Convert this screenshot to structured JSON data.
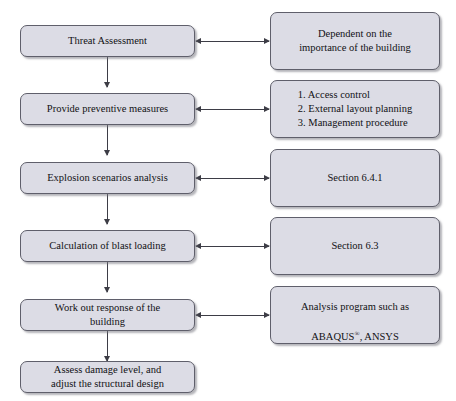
{
  "diagram": {
    "colors": {
      "node_fill": "#dcdce5",
      "node_border": "#5f5f6b",
      "connector": "#3d3d46",
      "background": "#ffffff",
      "text": "#111114"
    },
    "left_column": [
      {
        "id": "threat-assessment",
        "label": "Threat Assessment"
      },
      {
        "id": "preventive-measures",
        "label": "Provide preventive measures"
      },
      {
        "id": "explosion-scenarios",
        "label": "Explosion scenarios analysis"
      },
      {
        "id": "blast-loading",
        "label": "Calculation of blast loading"
      },
      {
        "id": "work-out-response",
        "label": "Work out response of the\nbuilding"
      },
      {
        "id": "assess-damage",
        "label": "Assess damage level, and\nadjust the structural design"
      }
    ],
    "right_column": [
      {
        "id": "dependent-importance",
        "label": "Dependent on the\nimportance of the building"
      },
      {
        "id": "preventive-measures-list",
        "label": "1. Access control\n2. External layout planning\n3. Management procedure"
      },
      {
        "id": "section-6-4-1",
        "label": "Section 6.4.1"
      },
      {
        "id": "section-6-3",
        "label": "Section 6.3"
      },
      {
        "id": "analysis-program",
        "label_line1": "Analysis program such as",
        "label_line2_prefix": "ABAQUS",
        "label_line2_mark": "®",
        "label_line2_suffix": ", ANSYS"
      }
    ],
    "connectors": {
      "vertical_count": 5,
      "horizontal_count": 5,
      "vertical_arrowhead": "down",
      "horizontal_arrowhead": "both"
    }
  }
}
